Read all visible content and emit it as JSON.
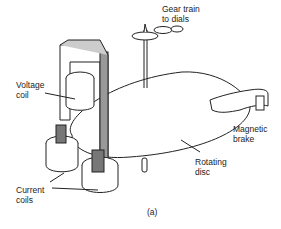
{
  "figure": {
    "caption": "(a)",
    "labels": {
      "gear_train": "Gear train\nto dials",
      "voltage_coil": "Voltage\ncoil",
      "magnetic_brake": "Magnetic\nbrake",
      "rotating_disc": "Rotating\ndisc",
      "current_coils": "Current\ncoils"
    }
  }
}
